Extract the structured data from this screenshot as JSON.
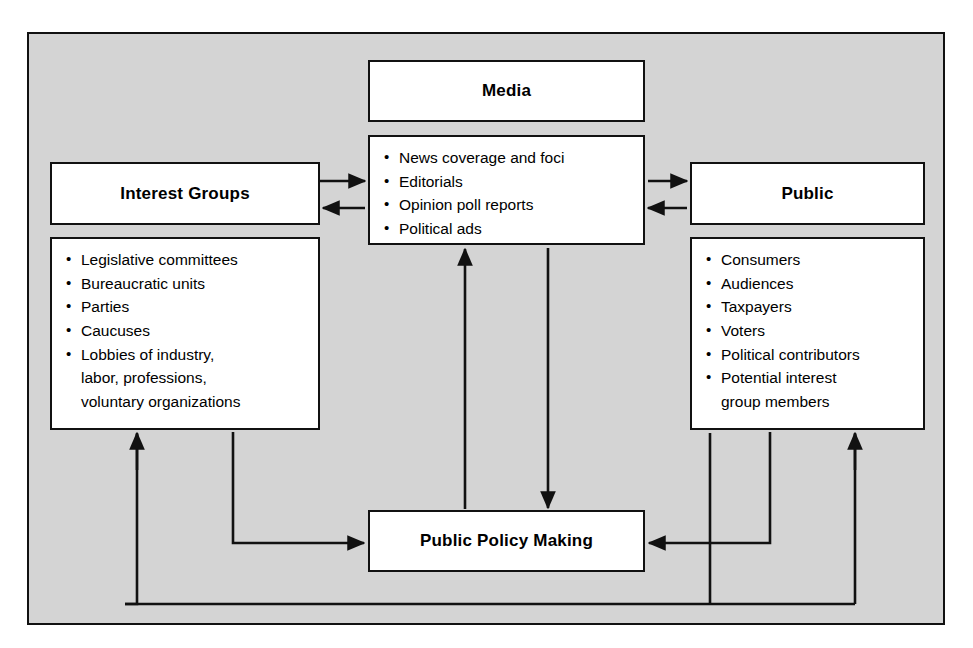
{
  "diagram": {
    "colors": {
      "plate_background": "#d4d4d4",
      "node_background": "#ffffff",
      "stroke": "#111111",
      "text": "#000000"
    }
  },
  "nodes": {
    "media": {
      "label": "Media",
      "items": [
        "News coverage and foci",
        "Editorials",
        "Opinion poll reports",
        "Political ads"
      ]
    },
    "interest_groups": {
      "label": "Interest Groups",
      "items": [
        "Legislative committees",
        "Bureaucratic units",
        "Parties",
        "Caucuses",
        "Lobbies of industry,"
      ],
      "continuations": [
        "labor, professions,",
        "voluntary organizations"
      ]
    },
    "public": {
      "label": "Public",
      "items": [
        "Consumers",
        "Audiences",
        "Taxpayers",
        "Voters",
        "Political contributors",
        "Potential interest"
      ],
      "continuations": [
        "group members"
      ]
    },
    "policy": {
      "label": "Public Policy Making"
    }
  },
  "connections": [
    {
      "name": "interest-groups-to-media",
      "from": "interest_groups",
      "to": "media",
      "direction": "forward"
    },
    {
      "name": "media-to-interest-groups",
      "from": "media",
      "to": "interest_groups",
      "direction": "forward"
    },
    {
      "name": "media-to-public",
      "from": "media",
      "to": "public",
      "direction": "forward"
    },
    {
      "name": "public-to-media",
      "from": "public",
      "to": "media",
      "direction": "forward"
    },
    {
      "name": "policy-to-media",
      "from": "policy",
      "to": "media",
      "direction": "forward"
    },
    {
      "name": "media-to-policy",
      "from": "media",
      "to": "policy",
      "direction": "forward"
    },
    {
      "name": "interest-groups-to-policy",
      "from": "interest_groups",
      "to": "policy",
      "direction": "forward"
    },
    {
      "name": "public-to-policy",
      "from": "public",
      "to": "policy",
      "direction": "forward"
    },
    {
      "name": "policy-to-interest-groups",
      "from": "policy",
      "to": "interest_groups",
      "direction": "forward"
    },
    {
      "name": "policy-to-public",
      "from": "policy",
      "to": "public",
      "direction": "forward"
    }
  ]
}
